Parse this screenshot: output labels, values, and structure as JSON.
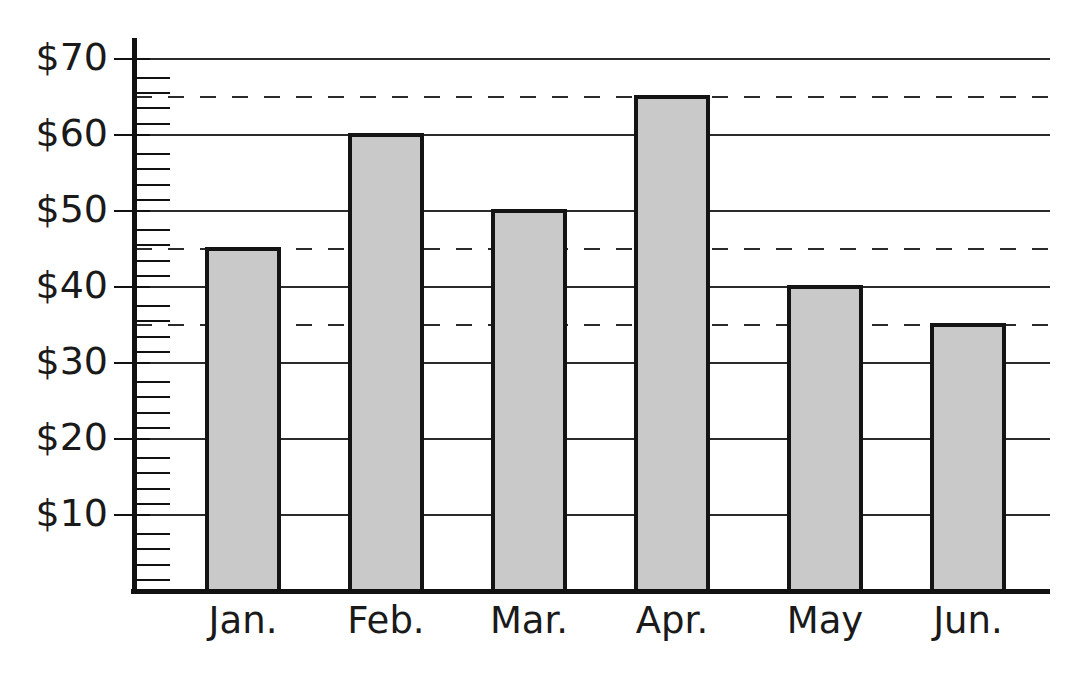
{
  "chart_data": {
    "type": "bar",
    "title": "",
    "subtitle": "",
    "xlabel": "",
    "ylabel": "",
    "categories": [
      "Jan.",
      "Feb.",
      "Mar.",
      "Apr.",
      "May",
      "Jun."
    ],
    "values": [
      45,
      60,
      50,
      65,
      40,
      35
    ],
    "series": [
      {
        "name": "",
        "values": [
          45,
          60,
          50,
          65,
          40,
          35
        ]
      }
    ],
    "ylim": [
      0,
      74
    ],
    "xlim": [
      0,
      6
    ],
    "y_tick_labels": [
      "$10",
      "$20",
      "$30",
      "$40",
      "$50",
      "$60",
      "$70"
    ],
    "y_tick_values": [
      10,
      20,
      30,
      40,
      50,
      60,
      70
    ],
    "y_minor_tick_interval": 2,
    "y_tick_prefix": "$",
    "grid": true,
    "grid_axis": "y",
    "legend": false,
    "legend_position": "none",
    "annotations": [
      {
        "name": "reference-line-65",
        "type": "hline",
        "value": 65,
        "style": "dashed"
      },
      {
        "name": "reference-line-45",
        "type": "hline",
        "value": 45,
        "style": "dashed"
      },
      {
        "name": "reference-line-35",
        "type": "hline",
        "value": 35,
        "style": "dashed"
      }
    ],
    "colors": {
      "bar_fill": "#c9c9c9",
      "bar_stroke": "#141414",
      "gridline": "#2b2b2b",
      "axis": "#111111",
      "dashed_reference": "#2b2b2b",
      "text": "#1a1a1a",
      "background": "#ffffff"
    }
  },
  "axis_labels": {
    "y": {
      "t10": "$10",
      "t20": "$20",
      "t30": "$30",
      "t40": "$40",
      "t50": "$50",
      "t60": "$60",
      "t70": "$70"
    },
    "x": {
      "c0": "Jan.",
      "c1": "Feb.",
      "c2": "Mar.",
      "c3": "Apr.",
      "c4": "May",
      "c5": "Jun."
    }
  }
}
